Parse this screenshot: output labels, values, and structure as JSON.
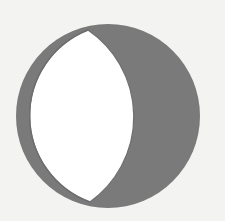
{
  "diagram": {
    "type": "moon-phase",
    "phase": "gibbous",
    "lit_side": "left",
    "colors": {
      "background": "#f3f3f1",
      "lit": "#ffffff",
      "shadow": "#7a7a7a",
      "outline": "#6e6e6e"
    }
  }
}
